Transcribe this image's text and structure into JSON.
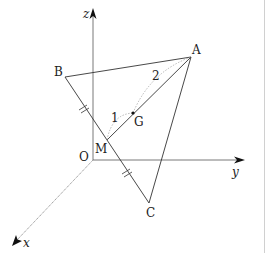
{
  "diagram": {
    "title": "",
    "axes": {
      "x": {
        "label": "x"
      },
      "y": {
        "label": "y"
      },
      "z": {
        "label": "z"
      },
      "origin": {
        "label": "O"
      }
    },
    "points": {
      "A": {
        "label": "A"
      },
      "B": {
        "label": "B"
      },
      "C": {
        "label": "C"
      },
      "M": {
        "label": "M"
      },
      "G": {
        "label": "G"
      }
    },
    "ratio_labels": {
      "MG": "1",
      "GA": "2"
    },
    "colors": {
      "line": "#333333",
      "axis": "#555555",
      "dotted": "#999999",
      "text": "#222222"
    }
  }
}
